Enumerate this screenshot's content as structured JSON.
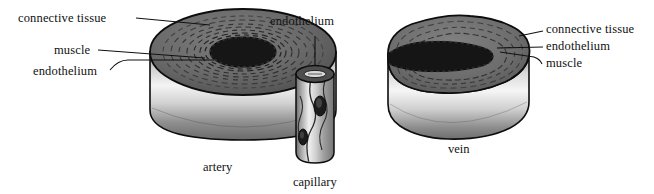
{
  "figure": {
    "background": "#ffffff",
    "ink": "#111111"
  },
  "palette": {
    "outline": "#0d0d0d",
    "connective_tissue": "#6e6e6e",
    "muscle_band": "#585858",
    "lumen": "#1a1a1a",
    "wall_light": "#f2f2f2",
    "wall_mid": "#b9b9b9",
    "wall_dark": "#6a6a6a",
    "capillary_light": "#e8e8e8",
    "capillary_dark": "#7a7a7a"
  },
  "vessels": [
    {
      "id": "artery",
      "caption": "artery",
      "shape": "thick-walled circular cylinder with concentric wall rings and small round lumen"
    },
    {
      "id": "capillary",
      "caption": "capillary",
      "shape": "narrow thin-walled tube of single endothelial cell layer with visible nuclei"
    },
    {
      "id": "vein",
      "caption": "vein",
      "shape": "thin-walled irregular oval cylinder with large collapsed slit-like lumen"
    }
  ],
  "labels": {
    "artery": [
      {
        "id": "artery-connective-tissue",
        "text": "connective tissue"
      },
      {
        "id": "artery-muscle",
        "text": "muscle"
      },
      {
        "id": "artery-endothelium",
        "text": "endothelium"
      }
    ],
    "capillary": [
      {
        "id": "capillary-endothelium",
        "text": "endothelium"
      }
    ],
    "vein": [
      {
        "id": "vein-connective-tissue",
        "text": "connective tissue"
      },
      {
        "id": "vein-endothelium",
        "text": "endothelium"
      },
      {
        "id": "vein-muscle",
        "text": "muscle"
      }
    ]
  },
  "captions": {
    "artery": "artery",
    "capillary": "capillary",
    "vein": "vein"
  }
}
